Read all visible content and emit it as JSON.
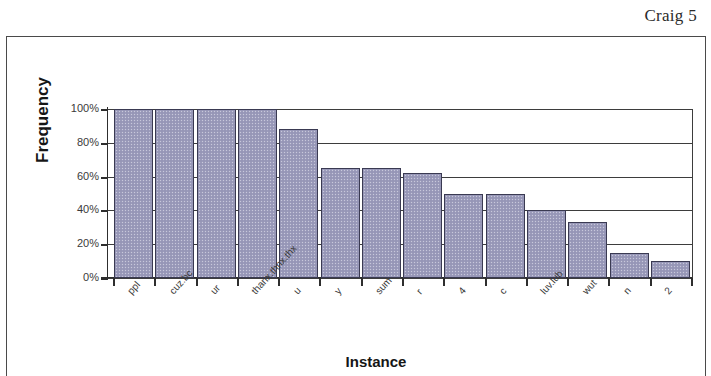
{
  "page": {
    "header_label": "Craig 5"
  },
  "chart_data": {
    "type": "bar",
    "title": "",
    "xlabel": "Instance",
    "ylabel": "Frequency",
    "categories": [
      "ppl",
      "cuz.bc",
      "ur",
      "thanx.thnx.thx",
      "u",
      "y",
      "sum",
      "r",
      "4",
      "c",
      "luv.lub",
      "wut",
      "n",
      "2"
    ],
    "values": [
      100,
      100,
      100,
      100,
      88,
      65,
      65,
      62,
      50,
      50,
      40,
      33,
      15,
      10
    ],
    "ylim": [
      0,
      100
    ],
    "ytick_labels": [
      "100%",
      "80%",
      "60%",
      "40%",
      "20%",
      "0%"
    ],
    "ytick_values": [
      100,
      80,
      60,
      40,
      20,
      0
    ],
    "grid": true,
    "legend": false,
    "bar_color": "#9b9bbb",
    "bar_border_color": "#3a3a52",
    "axis_color": "#2e2e2e"
  }
}
